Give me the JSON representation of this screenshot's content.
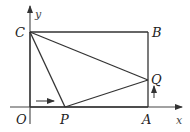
{
  "diagram": {
    "axes": {
      "x_label": "x",
      "y_label": "y"
    },
    "points": {
      "O": {
        "label": "O"
      },
      "A": {
        "label": "A"
      },
      "B": {
        "label": "B"
      },
      "C": {
        "label": "C"
      },
      "P": {
        "label": "P"
      },
      "Q": {
        "label": "Q"
      }
    },
    "segments": [
      "OA",
      "AB",
      "BC",
      "CO",
      "CP",
      "PQ",
      "CQ"
    ],
    "motion_arrows": [
      {
        "name": "P moves right along OA",
        "direction": "right"
      },
      {
        "name": "Q moves up along AB",
        "direction": "up"
      }
    ]
  }
}
